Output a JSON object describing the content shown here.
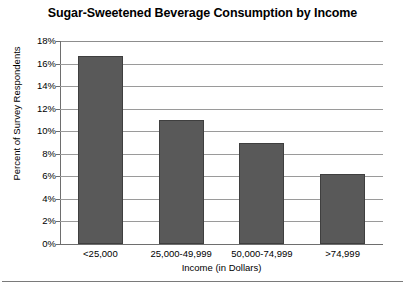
{
  "chart_data": {
    "type": "bar",
    "title": "Sugar-Sweetened Beverage Consumption by Income",
    "xlabel": "Income (in Dollars)",
    "ylabel": "Percent of Survey Respondents",
    "categories": [
      "<25,000",
      "25,000-49,999",
      "50,000-74,999",
      ">74,999"
    ],
    "values": [
      16.7,
      11.0,
      9.0,
      6.2
    ],
    "ylim": [
      0,
      18
    ],
    "ytick_step": 2,
    "ytick_labels": [
      "18%",
      "16%",
      "14%",
      "12%",
      "10%",
      "8%",
      "6%",
      "4%",
      "2%",
      "0%"
    ],
    "ytick_values": [
      18,
      16,
      14,
      12,
      10,
      8,
      6,
      4,
      2,
      0
    ],
    "grid": true,
    "legend": false,
    "bar_color": "#595959",
    "bar_edge_color": "#3f3f3f",
    "gridline_color": "#9a9a9a",
    "axis_color": "#6e6e6e",
    "background_color": "#ffffff"
  }
}
